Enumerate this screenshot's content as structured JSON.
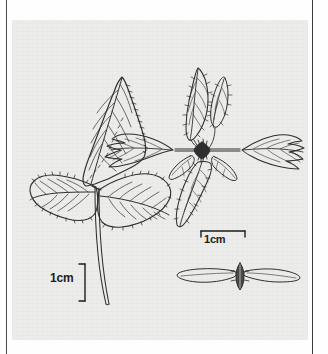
{
  "figure": {
    "caption_visible": false,
    "background_color": "#ececeb",
    "ink_color": "#2b2b2b",
    "page_color": "#fefefe"
  },
  "panel": {
    "rule_left_label": "page-rule-left",
    "rule_right_label": "page-rule-right"
  },
  "specimens": [
    {
      "id": "trifoliate-leaf",
      "name": "Trifoliate compound leaf",
      "leaflet_count": 3,
      "margin": "serrate",
      "venation": "pinnate",
      "has_petiole": true
    },
    {
      "id": "inflorescence-cluster",
      "name": "Bract and inflorescence cluster",
      "arrangement": "opposite on horizontal axis",
      "margin": "deeply lobed",
      "has_central_node": true
    },
    {
      "id": "winged-fruit",
      "name": "Winged fruit (samara)",
      "wing_count": 2,
      "has_central_seed": true
    }
  ],
  "scale_bars": [
    {
      "id": "scale-bar-leaf",
      "label": "1cm",
      "orientation": "vertical",
      "bracket_side": "right"
    },
    {
      "id": "scale-bar-fruit",
      "label": "1cm",
      "orientation": "horizontal",
      "bracket_side": "top"
    }
  ]
}
